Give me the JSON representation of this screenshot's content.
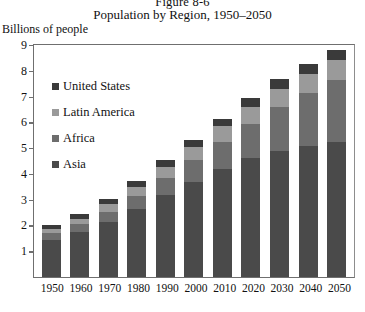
{
  "figure": {
    "number": "Figure 8-6",
    "title": "Population by Region, 1950–2050",
    "axis_caption": "Billions of people"
  },
  "legend": {
    "items": [
      {
        "label": "United States",
        "color": "#3a3a3a"
      },
      {
        "label": "Latin America",
        "color": "#9a9a9a"
      },
      {
        "label": "Africa",
        "color": "#6d6d6d"
      },
      {
        "label": "Asia",
        "color": "#4a4a4a"
      }
    ]
  },
  "chart_data": {
    "type": "bar",
    "subtype": "stacked-vertical",
    "title": "Population by Region, 1950–2050",
    "xlabel": "",
    "ylabel": "Billions of people",
    "ylim": [
      0,
      9
    ],
    "yticks": [
      9,
      8,
      7,
      6,
      5,
      4,
      3,
      2,
      1
    ],
    "grid": false,
    "legend_position": "inside-upper-left",
    "categories": [
      "1950",
      "1960",
      "1970",
      "1980",
      "1990",
      "2000",
      "2010",
      "2020",
      "2030",
      "2040",
      "2050"
    ],
    "series": [
      {
        "name": "Asia",
        "color": "#4a4a4a",
        "values": [
          1.45,
          1.75,
          2.15,
          2.65,
          3.2,
          3.7,
          4.2,
          4.6,
          4.9,
          5.1,
          5.25
        ]
      },
      {
        "name": "Africa",
        "color": "#6d6d6d",
        "values": [
          0.25,
          0.3,
          0.38,
          0.49,
          0.64,
          0.83,
          1.05,
          1.35,
          1.7,
          2.05,
          2.4
        ]
      },
      {
        "name": "Latin America",
        "color": "#9a9a9a",
        "values": [
          0.17,
          0.22,
          0.29,
          0.36,
          0.44,
          0.52,
          0.59,
          0.66,
          0.71,
          0.74,
          0.76
        ]
      },
      {
        "name": "United States",
        "color": "#3a3a3a",
        "values": [
          0.16,
          0.18,
          0.21,
          0.23,
          0.25,
          0.28,
          0.31,
          0.34,
          0.36,
          0.38,
          0.4
        ]
      }
    ],
    "totals": [
      2.03,
      2.45,
      3.03,
      3.73,
      4.53,
      5.33,
      6.15,
      6.95,
      7.67,
      8.27,
      8.81
    ]
  }
}
